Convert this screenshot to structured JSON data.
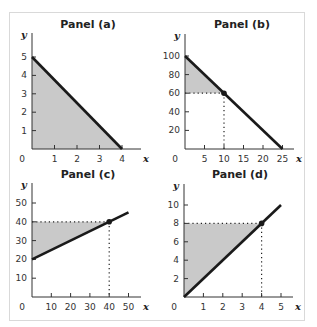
{
  "chart_data": [
    {
      "type": "line",
      "title": "Panel (a)",
      "xlabel": "x",
      "ylabel": "y",
      "xlim": [
        0,
        4.6
      ],
      "ylim": [
        0,
        5.6
      ],
      "xticks": [
        1,
        2,
        3,
        4
      ],
      "yticks": [
        1,
        2,
        3,
        4,
        5
      ],
      "origin_label": "0",
      "line": [
        [
          0,
          5
        ],
        [
          4,
          0
        ]
      ],
      "shaded_region": [
        [
          0,
          0
        ],
        [
          0,
          5
        ],
        [
          4,
          0
        ]
      ],
      "point": null,
      "guides": [],
      "grid": false
    },
    {
      "type": "line",
      "title": "Panel (b)",
      "xlabel": "x",
      "ylabel": "y",
      "xlim": [
        0,
        28
      ],
      "ylim": [
        0,
        112
      ],
      "xticks": [
        5,
        10,
        15,
        20,
        25
      ],
      "yticks": [
        20,
        40,
        60,
        80,
        100
      ],
      "origin_label": "0",
      "line": [
        [
          0,
          100
        ],
        [
          25,
          0
        ]
      ],
      "shaded_region": [
        [
          0,
          60
        ],
        [
          0,
          100
        ],
        [
          10,
          60
        ]
      ],
      "point": [
        10,
        60
      ],
      "guides": [
        [
          [
            0,
            60
          ],
          [
            10,
            60
          ]
        ],
        [
          [
            10,
            60
          ],
          [
            10,
            0
          ]
        ]
      ],
      "grid": false
    },
    {
      "type": "line",
      "title": "Panel (c)",
      "xlabel": "x",
      "ylabel": "y",
      "xlim": [
        0,
        56
      ],
      "ylim": [
        0,
        56
      ],
      "xticks": [
        10,
        20,
        30,
        40,
        50
      ],
      "yticks": [
        10,
        20,
        30,
        40,
        50
      ],
      "origin_label": "0",
      "line": [
        [
          0,
          20
        ],
        [
          50,
          45
        ]
      ],
      "shaded_region": [
        [
          0,
          20
        ],
        [
          0,
          40
        ],
        [
          40,
          40
        ]
      ],
      "point": [
        40,
        40
      ],
      "guides": [
        [
          [
            0,
            40
          ],
          [
            40,
            40
          ]
        ],
        [
          [
            40,
            40
          ],
          [
            40,
            0
          ]
        ]
      ],
      "grid": false
    },
    {
      "type": "line",
      "title": "Panel (d)",
      "xlabel": "x",
      "ylabel": "y",
      "xlim": [
        0,
        5.6
      ],
      "ylim": [
        0,
        11.2
      ],
      "xticks": [
        1,
        2,
        3,
        4,
        5
      ],
      "yticks": [
        2,
        4,
        6,
        8,
        10
      ],
      "origin_label": "0",
      "line": [
        [
          0,
          0
        ],
        [
          5,
          10
        ]
      ],
      "shaded_region": [
        [
          0,
          0
        ],
        [
          0,
          8
        ],
        [
          4,
          8
        ]
      ],
      "point": [
        4,
        8
      ],
      "guides": [
        [
          [
            0,
            8
          ],
          [
            4,
            8
          ]
        ],
        [
          [
            4,
            8
          ],
          [
            4,
            0
          ]
        ]
      ],
      "grid": false
    }
  ],
  "layout": [
    {
      "ox": 32,
      "oy": 149,
      "xscale": 22.5,
      "yscale": 18.4,
      "axis_right": 141,
      "axis_top": 33,
      "title_x": 88,
      "title_y": 28
    },
    {
      "ox": 185,
      "oy": 149,
      "xscale": 3.9,
      "yscale": 0.93,
      "axis_right": 294,
      "axis_top": 34,
      "title_x": 242,
      "title_y": 28
    },
    {
      "ox": 32,
      "oy": 297,
      "xscale": 1.93,
      "yscale": 1.88,
      "axis_right": 141,
      "axis_top": 183,
      "title_x": 88,
      "title_y": 178
    },
    {
      "ox": 184,
      "oy": 297,
      "xscale": 19.4,
      "yscale": 9.2,
      "axis_right": 293,
      "axis_top": 184,
      "title_x": 240,
      "title_y": 178
    }
  ],
  "colors": {
    "line": "#1a1a1a",
    "shade": "#c9c9c9",
    "axis": "#333333",
    "guide": "#222222",
    "frame": "#d9d9d9"
  }
}
